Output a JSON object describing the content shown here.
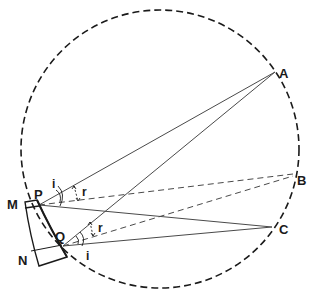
{
  "diagram": {
    "type": "optics-geometry",
    "circle": {
      "cx": 160,
      "cy": 149,
      "r": 139,
      "style": "dashed"
    },
    "points": {
      "A": {
        "label": "A",
        "x": 275,
        "y": 72
      },
      "B": {
        "label": "B",
        "x": 294,
        "y": 176
      },
      "C": {
        "label": "C",
        "x": 272,
        "y": 227
      },
      "P": {
        "label": "P",
        "x": 39,
        "y": 205
      },
      "Q": {
        "label": "Q",
        "x": 63,
        "y": 246
      },
      "M": {
        "label": "M"
      },
      "N": {
        "label": "N"
      }
    },
    "rays": [
      {
        "from": "P",
        "to": "A",
        "style": "solid"
      },
      {
        "from": "P",
        "to": "B",
        "style": "dashed"
      },
      {
        "from": "P",
        "to": "C",
        "style": "solid"
      },
      {
        "from": "Q",
        "to": "A",
        "style": "solid"
      },
      {
        "from": "Q",
        "to": "B",
        "style": "dashed"
      },
      {
        "from": "Q",
        "to": "C",
        "style": "solid"
      }
    ],
    "angle_labels": {
      "p_incidence": "i",
      "p_reflection": "r",
      "q_reflection": "r",
      "q_incidence": "i"
    },
    "colors": {
      "stroke": "#1a1a1a",
      "ray": "#4a4a4a",
      "background": "#ffffff"
    }
  }
}
